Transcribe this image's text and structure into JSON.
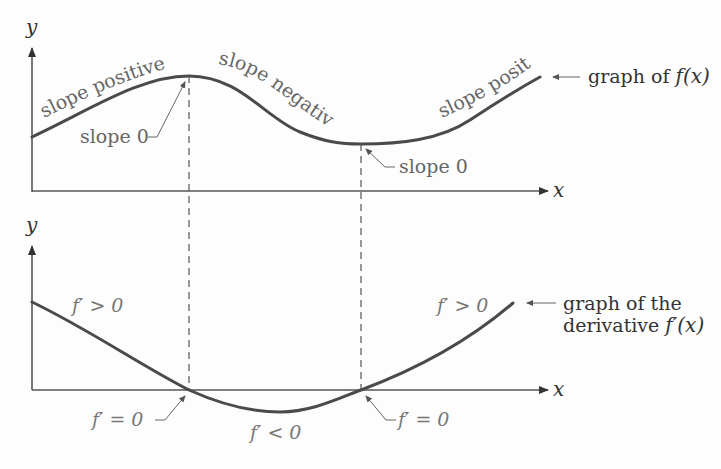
{
  "top_graph": {
    "y_axis_label": "y",
    "x_axis_label": "x",
    "curve_label_left": "slope positive",
    "curve_label_middle": "slope negative",
    "curve_label_right": "slope positive",
    "max_point_label": "slope 0",
    "min_point_label": "slope 0",
    "graph_label_prefix": "graph of ",
    "graph_label_func": "f(x)"
  },
  "bottom_graph": {
    "y_axis_label": "y",
    "x_axis_label": "x",
    "left_region_label": "f′ > 0",
    "middle_region_label": "f′ < 0",
    "right_region_label": "f′ > 0",
    "zero_left_label": "f′ = 0",
    "zero_right_label": "f′ = 0",
    "graph_label_line1": "graph of the",
    "graph_label_line2_prefix": "derivative ",
    "graph_label_line2_func": "f′(x)"
  },
  "colors": {
    "curve": "#4a4a4a",
    "axis": "#555555",
    "label": "#666666",
    "background": "#fdfdfd"
  }
}
